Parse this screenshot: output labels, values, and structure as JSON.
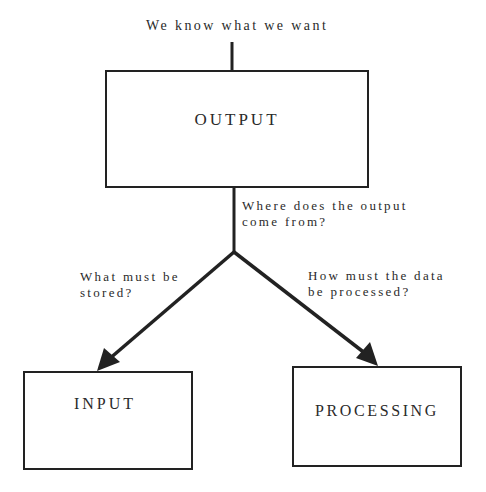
{
  "diagram": {
    "top_caption": "We know what we want",
    "nodes": {
      "output": {
        "label": "OUTPUT"
      },
      "input": {
        "label": "INPUT"
      },
      "processing": {
        "label": "PROCESSING"
      }
    },
    "annotations": {
      "where_line1": "Where does the output",
      "where_line2": "come from?",
      "stored_line1": "What must be",
      "stored_line2": "stored?",
      "processed_line1": "How must the data",
      "processed_line2": "be processed?"
    },
    "edges": [
      {
        "from": "caption",
        "to": "output",
        "type": "line"
      },
      {
        "from": "output",
        "to": "split",
        "type": "line"
      },
      {
        "from": "split",
        "to": "input",
        "type": "arrow"
      },
      {
        "from": "split",
        "to": "processing",
        "type": "arrow"
      }
    ],
    "colors": {
      "stroke": "#222222",
      "text": "#2a2a2a",
      "background": "#ffffff"
    }
  }
}
